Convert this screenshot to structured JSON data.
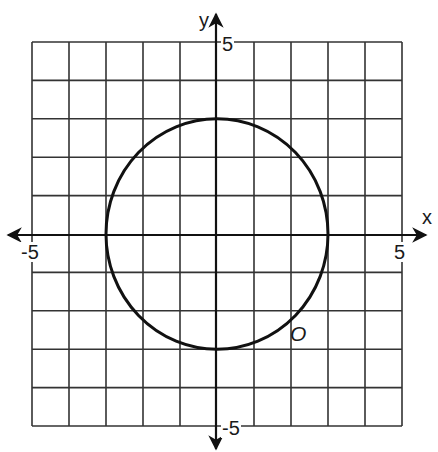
{
  "chart_data": {
    "type": "line",
    "title": "",
    "xlabel": "x",
    "ylabel": "y",
    "xlim": [
      -5,
      5
    ],
    "ylim": [
      -5,
      5
    ],
    "grid": true,
    "grid_step": 1,
    "x_tick_labels": [
      "-5",
      "5"
    ],
    "y_tick_labels": [
      "5",
      "-5"
    ],
    "series": [
      {
        "name": "O",
        "shape": "circle",
        "center": [
          0,
          0
        ],
        "radius": 3,
        "equation": "x^2 + y^2 = 9",
        "key_points": [
          [
            3,
            0
          ],
          [
            0,
            3
          ],
          [
            -3,
            0
          ],
          [
            0,
            -3
          ]
        ]
      }
    ],
    "annotations": [
      {
        "text": "O",
        "x": 2.1,
        "y": -2.7,
        "style": "italic"
      }
    ]
  },
  "labels": {
    "x_axis": "x",
    "y_axis": "y",
    "x_min": "-5",
    "x_max": "5",
    "y_max": "5",
    "y_min": "-5",
    "curve": "O"
  },
  "colors": {
    "grid": "#333333",
    "axis": "#111111",
    "curve": "#111111",
    "background": "#ffffff"
  }
}
